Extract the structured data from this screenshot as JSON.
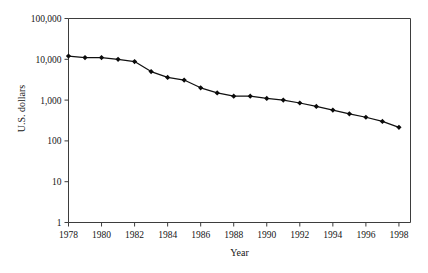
{
  "chart_data": {
    "type": "line",
    "title": "",
    "xlabel": "Year",
    "ylabel": "U.S. dollars",
    "yscale": "log",
    "ylim": [
      1,
      100000
    ],
    "xlim": [
      1978,
      1998.7
    ],
    "grid": false,
    "legend": null,
    "y_tick_labels": [
      "100,000",
      "10,000",
      "1,000",
      "100",
      "10",
      "1"
    ],
    "y_tick_values": [
      100000,
      10000,
      1000,
      100,
      10,
      1
    ],
    "x_tick_labels": [
      "1978",
      "1980",
      "1982",
      "1984",
      "1986",
      "1988",
      "1990",
      "1992",
      "1994",
      "1996",
      "1998"
    ],
    "x_tick_values": [
      1978,
      1980,
      1982,
      1984,
      1986,
      1988,
      1990,
      1992,
      1994,
      1996,
      1998
    ],
    "marker": "filled-diamond",
    "x": [
      1978,
      1979,
      1980,
      1981,
      1982,
      1983,
      1984,
      1985,
      1986,
      1987,
      1988,
      1989,
      1990,
      1991,
      1992,
      1993,
      1994,
      1995,
      1996,
      1997,
      1998
    ],
    "values": [
      12000,
      11000,
      11000,
      10000,
      8800,
      5000,
      3600,
      3100,
      2000,
      1500,
      1250,
      1250,
      1100,
      1000,
      850,
      700,
      570,
      460,
      380,
      300,
      215
    ],
    "series": [
      {
        "name": "U.S. dollars",
        "values": [
          12000,
          11000,
          11000,
          10000,
          8800,
          5000,
          3600,
          3100,
          2000,
          1500,
          1250,
          1250,
          1100,
          1000,
          850,
          700,
          570,
          460,
          380,
          300,
          215
        ]
      }
    ]
  }
}
